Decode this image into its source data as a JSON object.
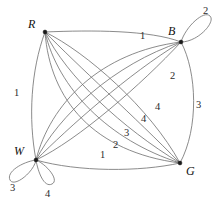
{
  "figure": {
    "type": "multigraph-diagram",
    "background_color": "#ffffff",
    "edge_color": "#6d6d6d",
    "vertex_color": "#1a1a1a",
    "label_color": "#2b2b2b",
    "width": 222,
    "height": 203
  },
  "vertices": [
    {
      "id": "R",
      "label": "R",
      "x": 45,
      "y": 32,
      "label_x": 28,
      "label_y": 18
    },
    {
      "id": "B",
      "label": "B",
      "x": 181,
      "y": 42,
      "label_x": 168,
      "label_y": 25
    },
    {
      "id": "W",
      "label": "W",
      "x": 36,
      "y": 160,
      "label_x": 14,
      "label_y": 145
    },
    {
      "id": "G",
      "label": "G",
      "x": 180,
      "y": 163,
      "label_x": 186,
      "label_y": 165
    }
  ],
  "edge_labels": [
    {
      "id": "label-rw",
      "text": "1",
      "x": 14,
      "y": 88,
      "edge": "R-W"
    },
    {
      "id": "label-rb",
      "text": "1",
      "x": 140,
      "y": 31,
      "edge": "R-B"
    },
    {
      "id": "label-bg",
      "text": "3",
      "x": 196,
      "y": 100,
      "edge": "B-G"
    },
    {
      "id": "label-wb-2",
      "text": "2",
      "x": 170,
      "y": 71,
      "edge": "W-B"
    },
    {
      "id": "label-wb-4",
      "text": "4",
      "x": 155,
      "y": 102,
      "edge": "W-B"
    },
    {
      "id": "label-rg-4",
      "text": "4",
      "x": 141,
      "y": 114,
      "edge": "R-G"
    },
    {
      "id": "label-rg-3",
      "text": "3",
      "x": 124,
      "y": 128,
      "edge": "R-G"
    },
    {
      "id": "label-rg-2",
      "text": "2",
      "x": 113,
      "y": 140,
      "edge": "R-G"
    },
    {
      "id": "label-rg-1",
      "text": "1",
      "x": 100,
      "y": 150,
      "edge": "R-G"
    },
    {
      "id": "label-loop-b",
      "text": "2",
      "x": 203,
      "y": 6,
      "edge": "B-B loop"
    },
    {
      "id": "label-loop-w3",
      "text": "3",
      "x": 10,
      "y": 183,
      "edge": "W-W loop"
    },
    {
      "id": "label-loop-w4",
      "text": "4",
      "x": 45,
      "y": 189,
      "edge": "W-W loop"
    }
  ],
  "edge_paths": [
    {
      "id": "edge-rw",
      "d": "M45,32 C31,70 28,118 36,160"
    },
    {
      "id": "edge-rb",
      "d": "M45,32 C92,30 150,30 181,42"
    },
    {
      "id": "edge-bg",
      "d": "M181,42 C197,72 199,128 180,163"
    },
    {
      "id": "edge-rg-a",
      "d": "M45,32 C86,52 150,108 180,163"
    },
    {
      "id": "edge-rg-b",
      "d": "M45,32 C76,64 136,118 180,163"
    },
    {
      "id": "edge-rg-c",
      "d": "M45,32 C66,76 122,128 180,163"
    },
    {
      "id": "edge-rg-d",
      "d": "M45,32 C58,88 108,140 180,163"
    },
    {
      "id": "edge-rg-e",
      "d": "M45,32 C50,100 94,152 180,163"
    },
    {
      "id": "edge-wb-a",
      "d": "M36,160 C78,140 142,84 181,42"
    },
    {
      "id": "edge-wb-b",
      "d": "M36,160 C68,128 128,74 181,42"
    },
    {
      "id": "edge-wb-c",
      "d": "M36,160 C58,116 114,64 181,42"
    },
    {
      "id": "edge-wb-d",
      "d": "M36,160 C50,104 100,52 181,42"
    },
    {
      "id": "edge-wg",
      "d": "M36,160 C78,172 140,172 180,163"
    },
    {
      "id": "loop-b",
      "d": "M181,42 C186,26 204,10 210,16 C216,22 198,42 181,42"
    },
    {
      "id": "loop-w-left",
      "d": "M36,160 C22,162 6,172 10,180 C14,188 34,172 36,160"
    },
    {
      "id": "loop-w-right",
      "d": "M36,160 C38,172 44,188 52,184 C60,180 46,164 36,160"
    }
  ]
}
